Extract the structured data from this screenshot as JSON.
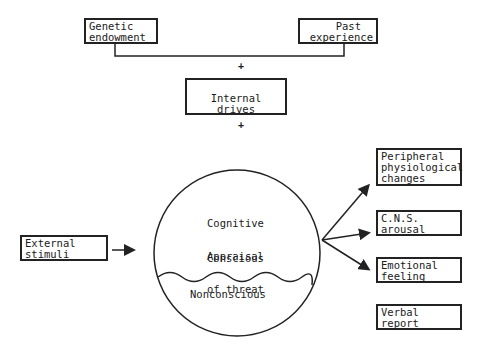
{
  "boxes": {
    "genetic": [
      "Genetic",
      "endowment"
    ],
    "past": [
      "Past",
      "experience"
    ],
    "internal": "Internal drives",
    "external": [
      "External",
      "stimuli"
    ],
    "peripheral": [
      "Peripheral",
      "physiological",
      "changes"
    ],
    "cns": [
      "C.N.S.",
      "arousal"
    ],
    "emotional": [
      "Emotional",
      "feeling"
    ],
    "verbal": [
      "Verbal",
      "report"
    ]
  },
  "circle": {
    "appraisal": [
      "Cognitive",
      "Appraisal",
      "of threat"
    ],
    "conscious": "Conscious",
    "nonconscious": "Nonconscious"
  },
  "connectors": {
    "plus1": "+",
    "plus2": "+"
  }
}
